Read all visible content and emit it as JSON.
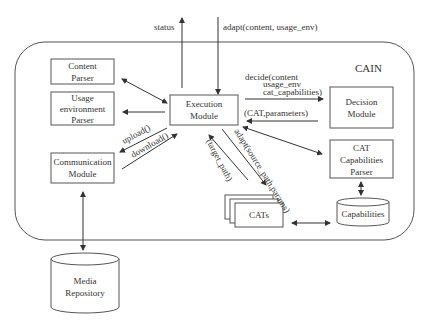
{
  "diagram": {
    "container": {
      "label": "CAIN"
    },
    "external": {
      "status_label": "status",
      "adapt_label": "adapt(content, usage_env)"
    },
    "nodes": {
      "content_parser": [
        "Content",
        "Parser"
      ],
      "usage_env_parser": [
        "Usage",
        "environment",
        "Parser"
      ],
      "communication_module": [
        "Communication",
        "Module"
      ],
      "media_repository": [
        "Media",
        "Repository"
      ],
      "execution_module": [
        "Execution",
        "Module"
      ],
      "decision_module": [
        "Decision",
        "Module"
      ],
      "cat_capabilities_parser": [
        "CAT",
        "Capabilities",
        "Parser"
      ],
      "cats": "CATs",
      "capabilities": "Capabilities"
    },
    "edges": {
      "decide": [
        "decide(content",
        "usage_env",
        "cat_capabilities)"
      ],
      "cat_parameters": "(CAT,parameters)",
      "upload": "upload()",
      "download": "download()",
      "target_path": "(target_path)",
      "adapt_source": "adapt(source_path,params)"
    },
    "colors": {
      "stroke": "#444444",
      "text": "#333333",
      "container_stroke": "#555555"
    }
  }
}
